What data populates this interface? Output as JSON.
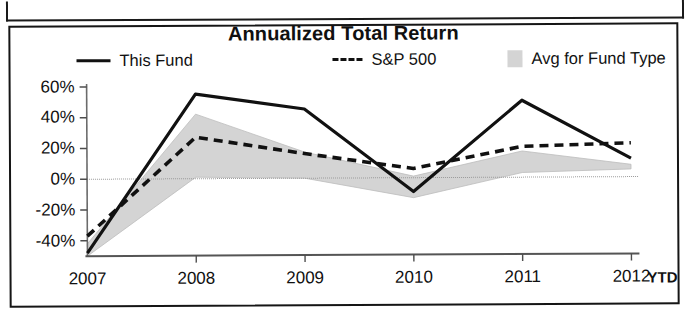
{
  "chart_data": {
    "type": "line",
    "title": "Annualized Total Return",
    "xlabel": "",
    "ylabel": "",
    "categories": [
      "2007",
      "2008",
      "2009",
      "2010",
      "2011",
      "2012"
    ],
    "x_axis_suffix": "YTD",
    "ytick_labels": [
      "60%",
      "40%",
      "20%",
      "0%",
      "-20%",
      "-40%"
    ],
    "ytick_values": [
      60,
      40,
      20,
      0,
      -20,
      -40
    ],
    "ylim": [
      -50,
      62
    ],
    "grid": false,
    "legend_position": "top",
    "series": [
      {
        "name": "This Fund",
        "style": "solid",
        "color": "#111111",
        "values": [
          -48,
          55,
          45,
          -9,
          50,
          12
        ]
      },
      {
        "name": "S&P 500",
        "style": "dashed",
        "color": "#111111",
        "values": [
          -37,
          27,
          16,
          6,
          20,
          22
        ]
      },
      {
        "name": "Avg for Fund Type",
        "style": "band",
        "color": "#d4d4d4",
        "upper": [
          -42,
          42,
          17,
          1,
          17,
          8
        ],
        "lower": [
          -50,
          1,
          0,
          -13,
          3,
          5
        ],
        "values": [
          -46,
          21,
          8,
          -6,
          10,
          6
        ]
      }
    ]
  },
  "chart": {
    "title": "Annualized Total Return",
    "legend": [
      {
        "label": "This Fund",
        "key": "solid-line-key"
      },
      {
        "label": "S&P 500",
        "key": "dashed-line-key"
      },
      {
        "label": "Avg for Fund Type",
        "key": "shaded-band-key"
      }
    ],
    "y_axis": {
      "ticks": [
        "60%",
        "40%",
        "20%",
        "0%",
        "-20%",
        "-40%"
      ]
    },
    "x_axis": {
      "ticks": [
        "2007",
        "2008",
        "2009",
        "2010",
        "2011",
        "2012"
      ],
      "suffix": "YTD"
    }
  }
}
